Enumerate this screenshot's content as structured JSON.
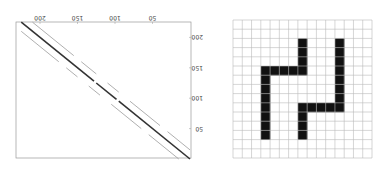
{
  "figure": {
    "orientation": "rotated-180",
    "spy_plot": {
      "matrix_size": 225,
      "x_ticks": [
        50,
        100,
        150,
        200
      ],
      "y_ticks": [
        50,
        100,
        150,
        200
      ],
      "x_tick_labels": [
        "50",
        "100",
        "150",
        "200"
      ],
      "y_tick_labels": [
        "50",
        "100",
        "150",
        "200"
      ],
      "diagonals": [
        {
          "offset": 0,
          "color": "#333333",
          "gaps": [
            [
              95,
              98
            ],
            [
              125,
              128
            ]
          ]
        },
        {
          "offset": 15,
          "color": "#9a9a9a",
          "gaps": [
            [
              40,
              50
            ],
            [
              90,
              105
            ],
            [
              120,
              135
            ],
            [
              150,
              160
            ]
          ]
        },
        {
          "offset": -15,
          "color": "#9a9a9a",
          "gaps": [
            [
              45,
              55
            ],
            [
              95,
              110
            ],
            [
              125,
              140
            ],
            [
              160,
              170
            ]
          ]
        }
      ]
    },
    "grid_domain": {
      "rows": 15,
      "cols": 15,
      "grid_color": "#bbbbbb",
      "fill_color": "#111111",
      "filled_cells": [
        [
          2,
          7
        ],
        [
          3,
          7
        ],
        [
          4,
          7
        ],
        [
          5,
          7
        ],
        [
          5,
          3
        ],
        [
          5,
          4
        ],
        [
          5,
          5
        ],
        [
          5,
          6
        ],
        [
          6,
          3
        ],
        [
          7,
          3
        ],
        [
          8,
          3
        ],
        [
          9,
          3
        ],
        [
          10,
          3
        ],
        [
          11,
          3
        ],
        [
          12,
          3
        ],
        [
          2,
          11
        ],
        [
          3,
          11
        ],
        [
          4,
          11
        ],
        [
          5,
          11
        ],
        [
          6,
          11
        ],
        [
          7,
          11
        ],
        [
          8,
          11
        ],
        [
          9,
          11
        ],
        [
          9,
          7
        ],
        [
          9,
          8
        ],
        [
          9,
          9
        ],
        [
          9,
          10
        ],
        [
          10,
          7
        ],
        [
          11,
          7
        ],
        [
          12,
          7
        ]
      ]
    }
  }
}
